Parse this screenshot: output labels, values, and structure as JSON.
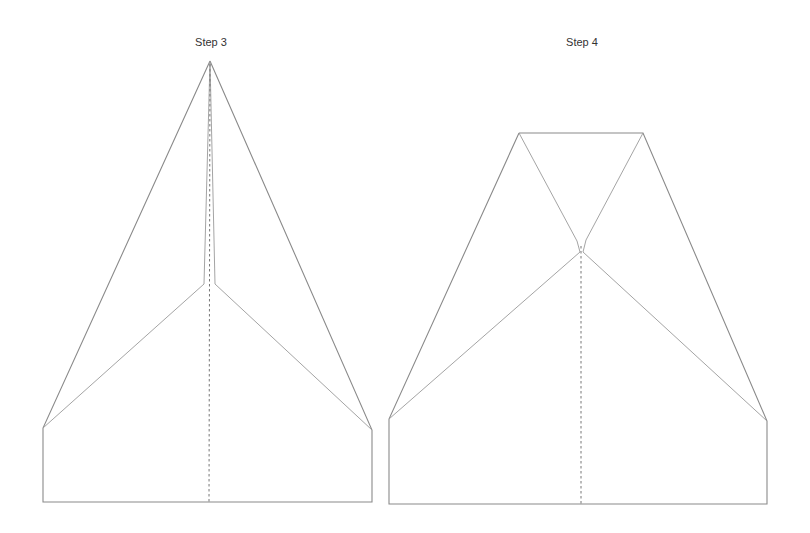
{
  "diagram": {
    "steps": [
      {
        "label": "Step 3",
        "label_pos": [
          211,
          43
        ]
      },
      {
        "label": "Step 4",
        "label_pos": [
          582,
          43
        ]
      }
    ],
    "colors": {
      "line": "#8a8a8a",
      "crease": "#777777",
      "text": "#333333",
      "background": "#ffffff"
    }
  }
}
